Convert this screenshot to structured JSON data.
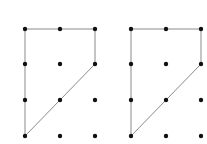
{
  "colors": {
    "background": "#ffffff",
    "dot": "#111111",
    "line": "#8a8a8a"
  },
  "grid": {
    "cols": 3,
    "rows": 4,
    "dot_radius": 2.2,
    "row_y": [
      29,
      64,
      100,
      136
    ]
  },
  "figures": [
    {
      "id": "left",
      "col_x": [
        25,
        60,
        95
      ],
      "polygon": [
        [
          0,
          0
        ],
        [
          2,
          0
        ],
        [
          2,
          1
        ],
        [
          0,
          3
        ]
      ]
    },
    {
      "id": "right",
      "col_x": [
        131,
        166,
        201
      ],
      "polygon": [
        [
          0,
          0
        ],
        [
          2,
          0
        ],
        [
          2,
          1
        ],
        [
          0,
          3
        ]
      ]
    }
  ]
}
